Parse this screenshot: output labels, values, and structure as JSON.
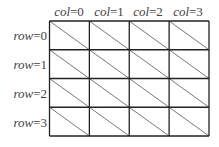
{
  "diagram": {
    "type": "grid",
    "rows": 4,
    "cols": 4,
    "col_labels": [
      {
        "var": "col",
        "eq": "=0"
      },
      {
        "var": "col",
        "eq": "=1"
      },
      {
        "var": "col",
        "eq": "=2"
      },
      {
        "var": "col",
        "eq": "=3"
      }
    ],
    "row_labels": [
      {
        "var": "row",
        "eq": "=0"
      },
      {
        "var": "row",
        "eq": "=1"
      },
      {
        "var": "row",
        "eq": "=2"
      },
      {
        "var": "row",
        "eq": "=3"
      }
    ],
    "cell_diagonal": "top-left to bottom-right",
    "line_color": "#222222",
    "diagonal_color": "#555555"
  }
}
